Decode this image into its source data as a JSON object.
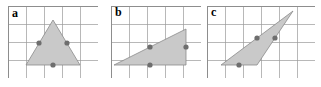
{
  "figure": {
    "background_color": "#ffffff",
    "grid": {
      "cell_size": 18,
      "line_color": "#9a9a9a",
      "line_width": 0.7,
      "border_color": "#8d8d8d"
    },
    "style": {
      "triangle_fill": "#c9c9c9",
      "triangle_stroke": "#8a8a8a",
      "triangle_stroke_width": 0.8,
      "dot_color": "#6e6e6e",
      "dot_radius": 2.6,
      "label_color": "#000000"
    }
  },
  "panels": [
    {
      "id": "panel-a",
      "label": "a",
      "label_x": 12,
      "label_y": 7,
      "x": 8,
      "y": 6,
      "grid_cols": 5,
      "grid_rows": 4,
      "width": 90,
      "height": 72,
      "triangle": {
        "shape": "isosceles",
        "vertices": [
          [
            45,
            14
          ],
          [
            18,
            59
          ],
          [
            72,
            59
          ]
        ]
      },
      "dots": [
        [
          31,
          37
        ],
        [
          59,
          37
        ],
        [
          45,
          59
        ]
      ]
    },
    {
      "id": "panel-b",
      "label": "b",
      "label_x": 115,
      "label_y": 6,
      "x": 111,
      "y": 6,
      "grid_cols": 5,
      "grid_rows": 4,
      "width": 90,
      "height": 72,
      "triangle": {
        "shape": "right",
        "vertices": [
          [
            3,
            59
          ],
          [
            75,
            23
          ],
          [
            75,
            59
          ]
        ]
      },
      "dots": [
        [
          39,
          41
        ],
        [
          75,
          41
        ],
        [
          39,
          59
        ]
      ]
    },
    {
      "id": "panel-c",
      "label": "c",
      "label_x": 211,
      "label_y": 6,
      "x": 207,
      "y": 6,
      "grid_cols": 6,
      "grid_rows": 4,
      "width": 108,
      "height": 72,
      "triangle": {
        "shape": "obtuse-sliver",
        "vertices": [
          [
            14,
            59
          ],
          [
            86,
            5
          ],
          [
            50,
            59
          ]
        ]
      },
      "dots": [
        [
          50,
          32
        ],
        [
          68,
          32
        ],
        [
          32,
          59
        ]
      ]
    }
  ]
}
